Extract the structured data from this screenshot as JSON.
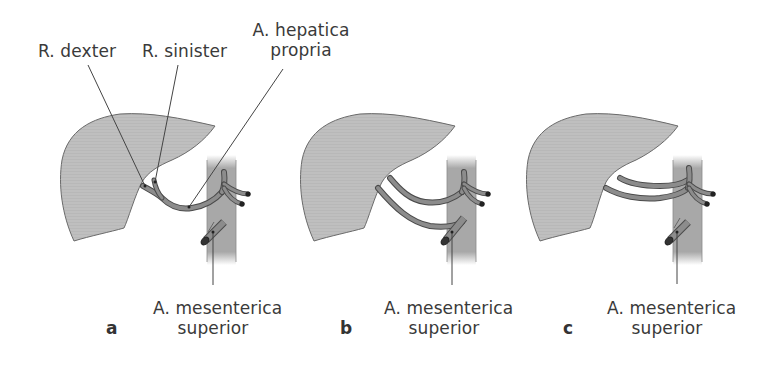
{
  "figure": {
    "labels": {
      "r_dexter": "R. dexter",
      "r_sinister": "R. sinister",
      "a_hepatica_line1": "A. hepatica",
      "a_hepatica_line2": "propria"
    },
    "panels": [
      {
        "letter": "a",
        "sma_line1": "A. mesenterica",
        "sma_line2": "superior"
      },
      {
        "letter": "b",
        "sma_line1": "A. mesenterica",
        "sma_line2": "superior"
      },
      {
        "letter": "c",
        "sma_line1": "A. mesenterica",
        "sma_line2": "superior"
      }
    ],
    "colors": {
      "liver_fill": "#bdbdbd",
      "liver_stroke": "#666666",
      "vessel_fill": "#8c8c8c",
      "vessel_stroke": "#4a4a4a",
      "aorta_fill": "#a9a9a9",
      "leader_line": "#444444",
      "text": "#3a3a3a"
    }
  }
}
